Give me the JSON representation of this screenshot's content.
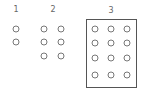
{
  "groups": [
    {
      "label": "1",
      "label_pos": [
        16,
        10
      ],
      "dots": [
        [
          16,
          29
        ],
        [
          16,
          42
        ]
      ],
      "boxed": false
    },
    {
      "label": "2",
      "label_pos": [
        53,
        10
      ],
      "dots": [
        [
          44,
          29
        ],
        [
          61,
          29
        ],
        [
          44,
          42
        ],
        [
          61,
          42
        ],
        [
          44,
          56
        ],
        [
          61,
          56
        ]
      ],
      "boxed": false
    },
    {
      "label": "3",
      "label_pos": [
        111,
        11
      ],
      "dots": [
        [
          95,
          29
        ],
        [
          111,
          29
        ],
        [
          127,
          29
        ],
        [
          95,
          43
        ],
        [
          111,
          43
        ],
        [
          127,
          43
        ],
        [
          95,
          58
        ],
        [
          111,
          58
        ],
        [
          127,
          58
        ],
        [
          95,
          75
        ],
        [
          111,
          75
        ],
        [
          127,
          75
        ]
      ],
      "boxed": true
    }
  ]
}
